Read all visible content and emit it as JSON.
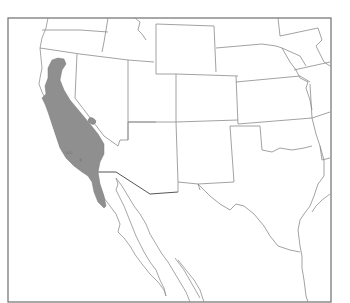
{
  "map": {
    "type": "species-range-map",
    "region": "Western United States and northern Mexico",
    "legend": [],
    "colors": {
      "background": "#ffffff",
      "frame": "#6e6e6e",
      "state_borders": "#8a8a8a",
      "range_fill": "#8f8f8f"
    },
    "range_description": "Shaded distribution covering coastal and central California (Coast Ranges, Central Valley, Sierra Nevada foothills) south into northern Baja California, with a small isolated patch near the California–Nevada border",
    "features": [
      "state-borders",
      "us-mexico-border",
      "baja-california-peninsula",
      "channel-islands"
    ]
  }
}
